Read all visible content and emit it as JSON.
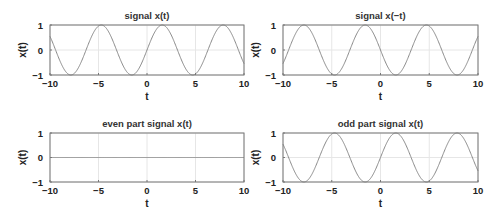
{
  "chart_data": [
    {
      "type": "line",
      "title": "signal x(t)",
      "xlabel": "t",
      "ylabel": "x(t)",
      "xlim": [
        -10,
        10
      ],
      "ylim": [
        -1,
        1
      ],
      "xticks": [
        -10,
        -5,
        0,
        5,
        10
      ],
      "yticks": [
        -1,
        0,
        1
      ],
      "grid": true,
      "function": "sin(t)",
      "series": [
        {
          "name": "x(t)",
          "expr": "sin",
          "sign": 1
        }
      ]
    },
    {
      "type": "line",
      "title": "signal x(−t)",
      "xlabel": "t",
      "ylabel": "x(t)",
      "xlim": [
        -10,
        10
      ],
      "ylim": [
        -1,
        1
      ],
      "xticks": [
        -10,
        -5,
        0,
        5,
        10
      ],
      "yticks": [
        -1,
        0,
        1
      ],
      "grid": true,
      "function": "-sin(t)",
      "series": [
        {
          "name": "x(-t)",
          "expr": "sin",
          "sign": -1
        }
      ]
    },
    {
      "type": "line",
      "title": "even part signal x(t)",
      "xlabel": "t",
      "ylabel": "x(t)",
      "xlim": [
        -10,
        10
      ],
      "ylim": [
        -1,
        1
      ],
      "xticks": [
        -10,
        -5,
        0,
        5,
        10
      ],
      "yticks": [
        -1,
        0,
        1
      ],
      "grid": true,
      "function": "0",
      "series": [
        {
          "name": "even part",
          "expr": "zero",
          "sign": 1
        }
      ]
    },
    {
      "type": "line",
      "title": "odd part signal x(t)",
      "xlabel": "t",
      "ylabel": "x(t)",
      "xlim": [
        -10,
        10
      ],
      "ylim": [
        -1,
        1
      ],
      "xticks": [
        -10,
        -5,
        0,
        5,
        10
      ],
      "yticks": [
        -1,
        0,
        1
      ],
      "grid": true,
      "function": "sin(t)",
      "series": [
        {
          "name": "odd part",
          "expr": "sin",
          "sign": 1
        }
      ]
    }
  ],
  "colors": {
    "line": "#8a8a8a",
    "axes": "#777777",
    "grid": "#e6e6e6"
  }
}
